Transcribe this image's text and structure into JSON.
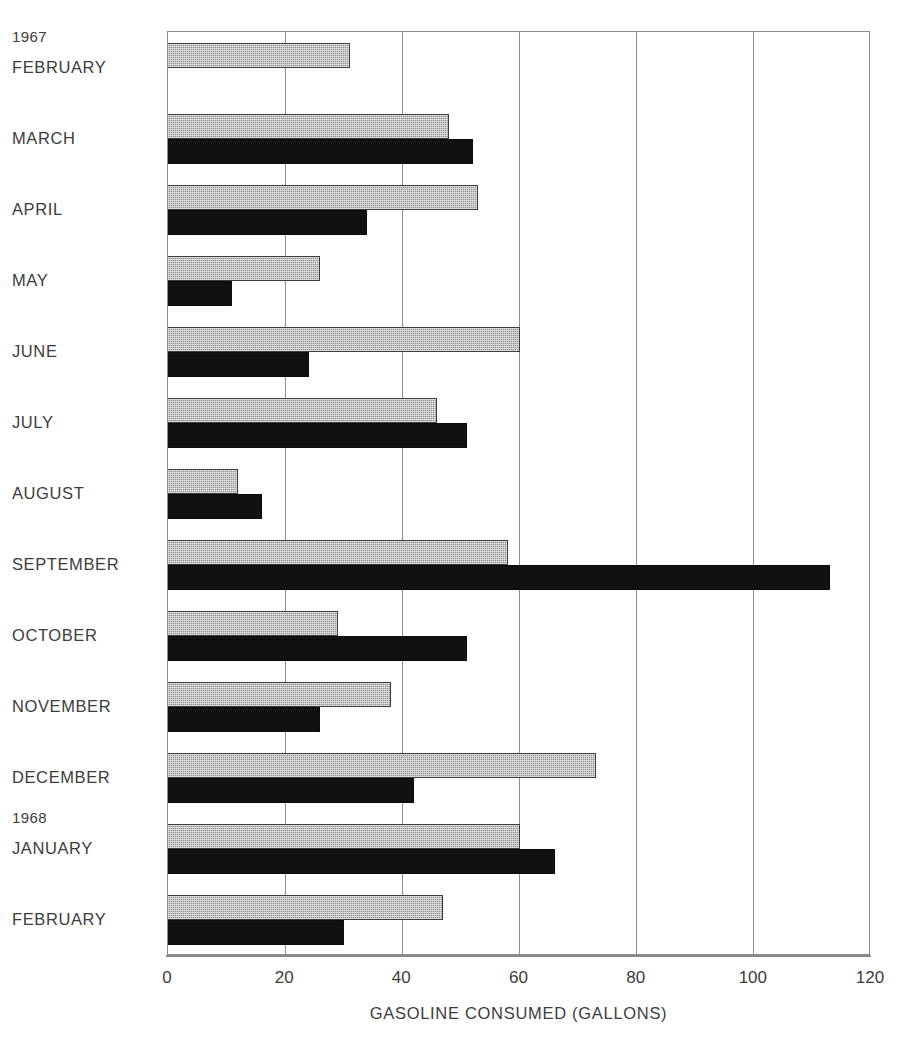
{
  "chart_data": {
    "type": "bar",
    "orientation": "horizontal",
    "title": "",
    "xlabel": "GASOLINE CONSUMED (GALLONS)",
    "ylabel": "",
    "xlim": [
      0,
      120
    ],
    "xticks": [
      0,
      20,
      40,
      60,
      80,
      100,
      120
    ],
    "xticklabels": [
      "0",
      "20",
      "40",
      "60",
      "80",
      "100",
      "120"
    ],
    "grid": "vertical",
    "legend": "none",
    "categories": [
      "FEBRUARY",
      "MARCH",
      "APRIL",
      "MAY",
      "JUNE",
      "JULY",
      "AUGUST",
      "SEPTEMBER",
      "OCTOBER",
      "NOVEMBER",
      "DECEMBER",
      "JANUARY",
      "FEBRUARY"
    ],
    "group_labels": [
      {
        "text": "1967",
        "before_category": "FEBRUARY"
      },
      {
        "text": "1968",
        "before_category": "JANUARY"
      }
    ],
    "series": [
      {
        "name": "gray-series",
        "color": "#919191",
        "pattern": "stippled",
        "values": [
          31,
          48,
          53,
          26,
          60,
          46,
          12,
          58,
          29,
          38,
          73,
          60,
          47
        ]
      },
      {
        "name": "dark-series",
        "color": "#111111",
        "pattern": "solid",
        "values": [
          null,
          52,
          34,
          11,
          24,
          51,
          16,
          113,
          51,
          26,
          42,
          66,
          30
        ]
      }
    ],
    "rows": [
      {
        "label": "FEBRUARY",
        "year": "1967",
        "gray": 31,
        "dark": null
      },
      {
        "label": "MARCH",
        "year": "",
        "gray": 48,
        "dark": 52
      },
      {
        "label": "APRIL",
        "year": "",
        "gray": 53,
        "dark": 34
      },
      {
        "label": "MAY",
        "year": "",
        "gray": 26,
        "dark": 11
      },
      {
        "label": "JUNE",
        "year": "",
        "gray": 60,
        "dark": 24
      },
      {
        "label": "JULY",
        "year": "",
        "gray": 46,
        "dark": 51
      },
      {
        "label": "AUGUST",
        "year": "",
        "gray": 12,
        "dark": 16
      },
      {
        "label": "SEPTEMBER",
        "year": "",
        "gray": 58,
        "dark": 113
      },
      {
        "label": "OCTOBER",
        "year": "",
        "gray": 29,
        "dark": 51
      },
      {
        "label": "NOVEMBER",
        "year": "",
        "gray": 38,
        "dark": 26
      },
      {
        "label": "DECEMBER",
        "year": "",
        "gray": 73,
        "dark": 42
      },
      {
        "label": "JANUARY",
        "year": "1968",
        "gray": 60,
        "dark": 66
      },
      {
        "label": "FEBRUARY",
        "year": "",
        "gray": 47,
        "dark": 30
      }
    ]
  },
  "axis": {
    "title": "GASOLINE CONSUMED (GALLONS)",
    "ticks": [
      "0",
      "20",
      "40",
      "60",
      "80",
      "100",
      "120"
    ]
  },
  "labels": {
    "year_1967": "1967",
    "year_1968": "1968",
    "months": [
      "FEBRUARY",
      "MARCH",
      "APRIL",
      "MAY",
      "JUNE",
      "JULY",
      "AUGUST",
      "SEPTEMBER",
      "OCTOBER",
      "NOVEMBER",
      "DECEMBER",
      "JANUARY",
      "FEBRUARY"
    ]
  },
  "colors": {
    "gray_series": "#919191",
    "dark_series": "#111111",
    "frame": "#8a8a8a",
    "text": "#3c3c3c",
    "background": "#ffffff"
  }
}
